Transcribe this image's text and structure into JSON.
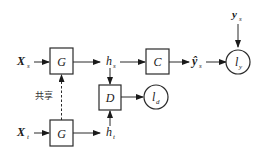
{
  "diagram": {
    "type": "domain-adaptation-architecture",
    "inputs": {
      "source": {
        "main": "X",
        "sub": "s"
      },
      "target": {
        "main": "X",
        "sub": "t"
      }
    },
    "blocks": {
      "generator_source": "G",
      "generator_target": "G",
      "classifier": "C",
      "discriminator": "D"
    },
    "features": {
      "source": {
        "main": "h",
        "sub": "s"
      },
      "target": {
        "main": "h",
        "sub": "t"
      }
    },
    "prediction": {
      "main": "ŷ",
      "sub": "s"
    },
    "label": {
      "main": "y",
      "sub": "s"
    },
    "losses": {
      "classification": {
        "main": "l",
        "sub": "y"
      },
      "domain": {
        "main": "l",
        "sub": "d"
      }
    },
    "shared_label": "共享",
    "edges": [
      {
        "from": "Xs",
        "to": "G(source)"
      },
      {
        "from": "G(source)",
        "to": "hs"
      },
      {
        "from": "hs",
        "to": "C"
      },
      {
        "from": "C",
        "to": "ŷs"
      },
      {
        "from": "ŷs",
        "to": "ly"
      },
      {
        "from": "ys",
        "to": "ly"
      },
      {
        "from": "hs",
        "to": "D"
      },
      {
        "from": "ht",
        "to": "D"
      },
      {
        "from": "D",
        "to": "ld"
      },
      {
        "from": "Xt",
        "to": "G(target)"
      },
      {
        "from": "G(target)",
        "to": "ht"
      },
      {
        "from": "G(target)",
        "to": "G(source)",
        "style": "dashed",
        "label": "共享"
      }
    ]
  }
}
